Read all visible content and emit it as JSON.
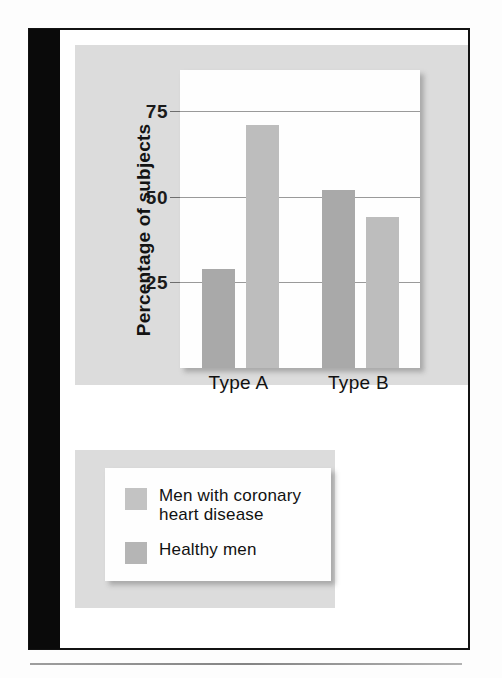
{
  "chart_data": {
    "type": "bar",
    "title": "",
    "xlabel": "",
    "ylabel": "Percentage of subjects",
    "categories": [
      "Type A",
      "Type B"
    ],
    "yticks": [
      25,
      50,
      75
    ],
    "ylim": [
      0,
      87
    ],
    "grid": true,
    "legend_position": "below-chart",
    "series": [
      {
        "name": "Men with coronary heart disease",
        "color": "#a9a9a9",
        "values": [
          29,
          52
        ]
      },
      {
        "name": "Healthy men",
        "color": "#bdbdbd",
        "values": [
          71,
          44
        ]
      }
    ]
  },
  "axis": {
    "y_title": "Percentage of subjects",
    "tick_labels": [
      "75",
      "50",
      "25"
    ]
  },
  "categories": [
    {
      "label": "Type A"
    },
    {
      "label": "Type B"
    }
  ],
  "bars": [
    {
      "name": "type-a-chd",
      "series": "Men with coronary heart disease",
      "category": "Type A",
      "value": 29
    },
    {
      "name": "type-a-healthy",
      "series": "Healthy men",
      "category": "Type A",
      "value": 71
    },
    {
      "name": "type-b-chd",
      "series": "Men with coronary heart disease",
      "category": "Type B",
      "value": 52
    },
    {
      "name": "type-b-healthy",
      "series": "Healthy men",
      "category": "Type B",
      "value": 44
    }
  ],
  "legend": {
    "items": [
      {
        "label_line1": "Men with coronary",
        "label_line2": "heart disease",
        "color": "#c3c3c3"
      },
      {
        "label_line1": "Healthy men",
        "label_line2": "",
        "color": "#b5b5b5"
      }
    ]
  },
  "colors": {
    "panel_gray": "#dcdcdc",
    "plot_white": "#fefefe",
    "gridline": "#9a9a9a",
    "frame_black": "#131313",
    "bar_chd": "#a9a9a9",
    "bar_healthy": "#bdbdbd"
  }
}
